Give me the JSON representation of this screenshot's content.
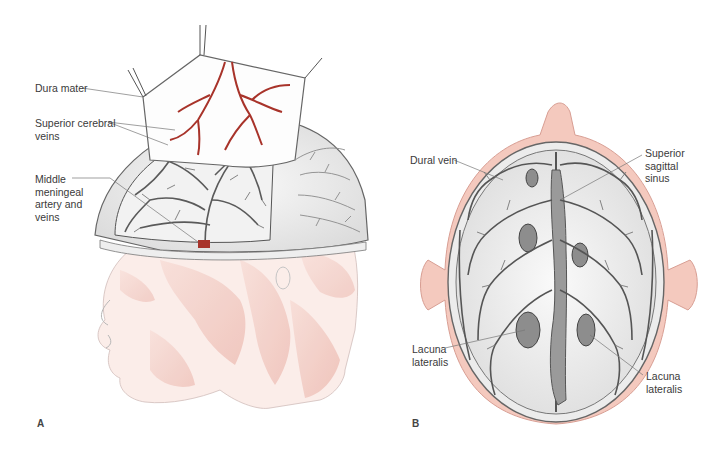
{
  "figure": {
    "panels": [
      {
        "id": "A",
        "letter": "A",
        "description": "Lateral view of head with dura mater reflected showing cerebral veins and meningeal vessels",
        "labels": [
          {
            "text": "Dura mater"
          },
          {
            "text": "Superior cerebral\nveins"
          },
          {
            "text": "Middle\nmeningeal\nartery and\nveins"
          }
        ]
      },
      {
        "id": "B",
        "letter": "B",
        "description": "Superior view of skull with calvaria removed showing dural veins and sagittal sinus",
        "labels": [
          {
            "text": "Dural vein"
          },
          {
            "text": "Superior\nsagittal\nsinus"
          },
          {
            "text": "Lacuna\nlateralis"
          },
          {
            "text": "Lacuna\nlateralis"
          }
        ]
      }
    ]
  },
  "colors": {
    "artery_red": "#a8332a",
    "vein_gray": "#555555",
    "muscle_pink": "#e7a69a",
    "scalp_pink": "#f0c2b6",
    "leader_line": "#777777",
    "text": "#3a3a3a"
  }
}
